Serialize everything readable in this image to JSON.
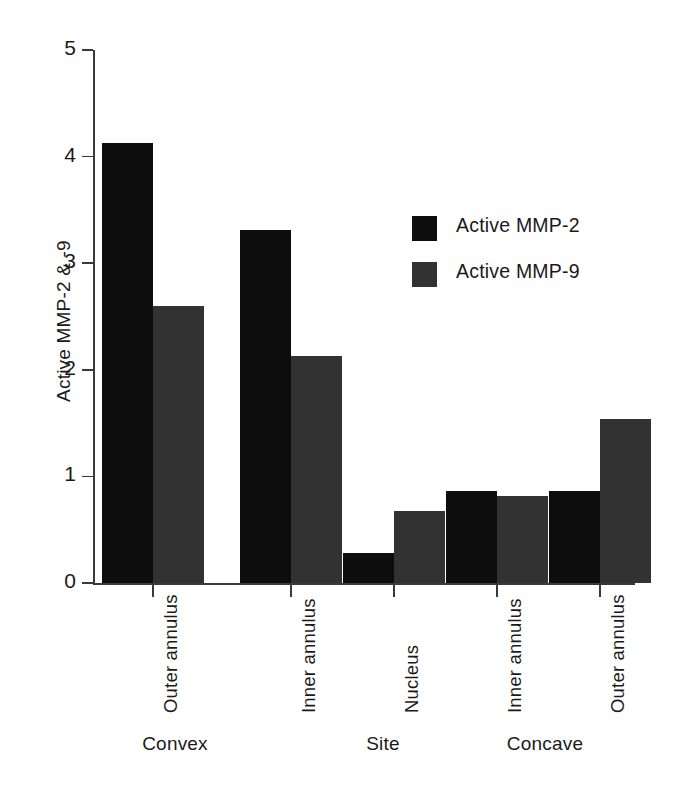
{
  "chart_data": {
    "type": "bar",
    "title": "",
    "subtitle": "",
    "xlabel": "Site",
    "ylabel": "Active MMP-2 & -9",
    "ylim": [
      0,
      5
    ],
    "yticks": [
      0,
      1,
      2,
      3,
      4,
      5
    ],
    "ytick_labels": [
      "0",
      "1",
      "2",
      "3",
      "4",
      "5"
    ],
    "grid": false,
    "legend_position": "upper-right-inside",
    "categories": [
      "Outer annulus",
      "Inner annulus",
      "Nucleus",
      "Inner annulus",
      "Outer annulus"
    ],
    "group_labels": [
      "Convex",
      "Site",
      "Concave"
    ],
    "series": [
      {
        "name": "Active MMP-2",
        "color": "#0d0d0d",
        "values": [
          4.13,
          3.31,
          0.28,
          0.86,
          0.86
        ]
      },
      {
        "name": "Active MMP-9",
        "color": "#323232",
        "values": [
          2.6,
          2.13,
          0.68,
          0.82,
          1.54
        ]
      }
    ]
  },
  "legend": {
    "items": [
      {
        "label": "Active MMP-2",
        "color": "#0d0d0d"
      },
      {
        "label": "Active MMP-9",
        "color": "#323232"
      }
    ]
  },
  "axes": {
    "y_title": "Active MMP-2 & -9",
    "y_ticks": [
      "0",
      "1",
      "2",
      "3",
      "4",
      "5"
    ]
  },
  "x_axis": {
    "tick_labels": [
      "Outer annulus",
      "Inner annulus",
      "Nucleus",
      "Inner annulus",
      "Outer annulus"
    ],
    "group_labels": [
      "Convex",
      "Site",
      "Concave"
    ]
  }
}
